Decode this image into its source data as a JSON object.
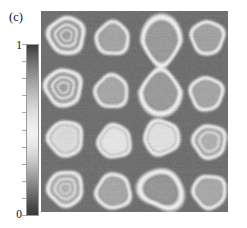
{
  "panel": {
    "label": "(c)"
  },
  "colorbar": {
    "name": "grayscale-colorbar",
    "max_label": "1",
    "min_label": "0",
    "orientation": "vertical",
    "tick_count": 11,
    "low_color": "#383838",
    "mid_color": "#f2f2f2",
    "high_color": "#3b3b3b"
  },
  "chart_data": {
    "type": "heatmap",
    "title": "(c)",
    "xlabel": "",
    "ylabel": "",
    "colorbar_label": "",
    "colorbar_ticks": [
      "0",
      "1"
    ],
    "zlim": [
      0,
      1
    ],
    "grid": false,
    "legend_position": "left",
    "colormap": "grayscale-ring-contrast",
    "background_level": 0.28,
    "rows": 4,
    "cols": 4,
    "cell_spacing_x": 46.5,
    "cell_spacing_y": 50.0,
    "features": [
      {
        "row": 1,
        "col": 1,
        "cx": 25,
        "cy": 24,
        "rx": 21,
        "ry": 21,
        "kind": "concentric-rings",
        "rings": 3,
        "center_level": 0.52,
        "ring_level": 0.94
      },
      {
        "row": 1,
        "col": 2,
        "cx": 71,
        "cy": 27,
        "rx": 19,
        "ry": 19,
        "kind": "single-ring",
        "rings": 1,
        "center_level": 0.55,
        "ring_level": 0.93
      },
      {
        "row": 1,
        "col": 3,
        "cx": 120,
        "cy": 30,
        "rx": 20,
        "ry": 26,
        "kind": "merged-figure-eight-top",
        "rings": 1,
        "center_level": 0.5,
        "ring_level": 0.95
      },
      {
        "row": 1,
        "col": 4,
        "cx": 166,
        "cy": 26,
        "rx": 19,
        "ry": 19,
        "kind": "single-ring",
        "rings": 1,
        "center_level": 0.54,
        "ring_level": 0.93
      },
      {
        "row": 2,
        "col": 1,
        "cx": 22,
        "cy": 76,
        "rx": 21,
        "ry": 21,
        "kind": "concentric-rings",
        "rings": 3,
        "center_level": 0.53,
        "ring_level": 0.94
      },
      {
        "row": 2,
        "col": 2,
        "cx": 70,
        "cy": 80,
        "rx": 19,
        "ry": 19,
        "kind": "single-ring",
        "rings": 1,
        "center_level": 0.56,
        "ring_level": 0.92
      },
      {
        "row": 2,
        "col": 3,
        "cx": 119,
        "cy": 80,
        "rx": 21,
        "ry": 24,
        "kind": "merged-figure-eight-bottom",
        "rings": 1,
        "center_level": 0.5,
        "ring_level": 0.95
      },
      {
        "row": 2,
        "col": 4,
        "cx": 165,
        "cy": 82,
        "rx": 19,
        "ry": 19,
        "kind": "single-ring",
        "rings": 1,
        "center_level": 0.55,
        "ring_level": 0.93
      },
      {
        "row": 3,
        "col": 1,
        "cx": 24,
        "cy": 127,
        "rx": 20,
        "ry": 20,
        "kind": "concentric-rings-bright-core",
        "rings": 3,
        "center_level": 0.82,
        "ring_level": 0.94
      },
      {
        "row": 3,
        "col": 2,
        "cx": 73,
        "cy": 130,
        "rx": 19,
        "ry": 19,
        "kind": "concentric-rings-bright-core",
        "rings": 2,
        "center_level": 0.88,
        "ring_level": 0.93
      },
      {
        "row": 3,
        "col": 3,
        "cx": 120,
        "cy": 126,
        "rx": 20,
        "ry": 20,
        "kind": "concentric-rings-bright-core",
        "rings": 2,
        "center_level": 0.86,
        "ring_level": 0.94
      },
      {
        "row": 3,
        "col": 4,
        "cx": 168,
        "cy": 130,
        "rx": 19,
        "ry": 19,
        "kind": "concentric-rings",
        "rings": 2,
        "center_level": 0.6,
        "ring_level": 0.93
      },
      {
        "row": 4,
        "col": 1,
        "cx": 24,
        "cy": 177,
        "rx": 20,
        "ry": 20,
        "kind": "concentric-rings",
        "rings": 3,
        "center_level": 0.62,
        "ring_level": 0.94
      },
      {
        "row": 4,
        "col": 2,
        "cx": 72,
        "cy": 180,
        "rx": 20,
        "ry": 20,
        "kind": "single-ring",
        "rings": 1,
        "center_level": 0.56,
        "ring_level": 0.93
      },
      {
        "row": 4,
        "col": 3,
        "cx": 120,
        "cy": 178,
        "rx": 21,
        "ry": 21,
        "kind": "irregular-thick-ring",
        "rings": 1,
        "center_level": 0.48,
        "ring_level": 0.95
      },
      {
        "row": 4,
        "col": 4,
        "cx": 168,
        "cy": 180,
        "rx": 19,
        "ry": 19,
        "kind": "single-ring",
        "rings": 1,
        "center_level": 0.57,
        "ring_level": 0.93
      }
    ]
  }
}
